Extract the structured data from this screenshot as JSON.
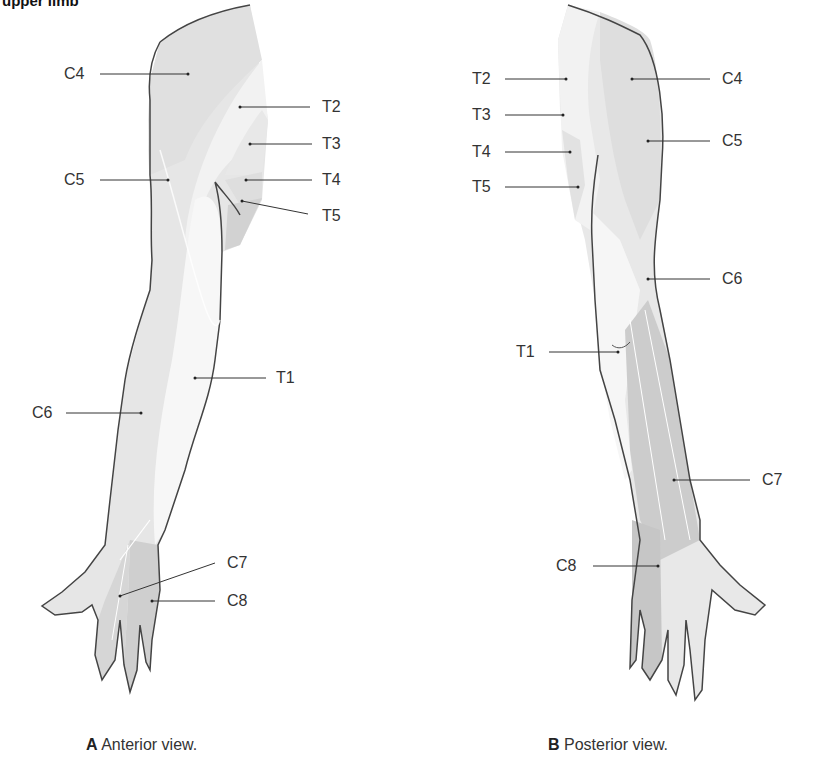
{
  "title": "upper limb",
  "anterior": {
    "caption_letter": "A",
    "caption_text": "Anterior view.",
    "labels": {
      "c4": "C4",
      "t2": "T2",
      "t3": "T3",
      "c5": "C5",
      "t4": "T4",
      "t5": "T5",
      "t1": "T1",
      "c6": "C6",
      "c7": "C7",
      "c8": "C8"
    }
  },
  "posterior": {
    "caption_letter": "B",
    "caption_text": "Posterior view.",
    "labels": {
      "t2": "T2",
      "c4": "C4",
      "t3": "T3",
      "c5": "C5",
      "t4": "T4",
      "t5": "T5",
      "c6": "C6",
      "t1": "T1",
      "c7": "C7",
      "c8": "C8"
    }
  },
  "colors": {
    "light_zone": "#f3f3f3",
    "mid_zone": "#e2e2e2",
    "dark_zone": "#cfcfcf",
    "darkest_zone": "#bdbdbd",
    "outline": "#444444"
  }
}
